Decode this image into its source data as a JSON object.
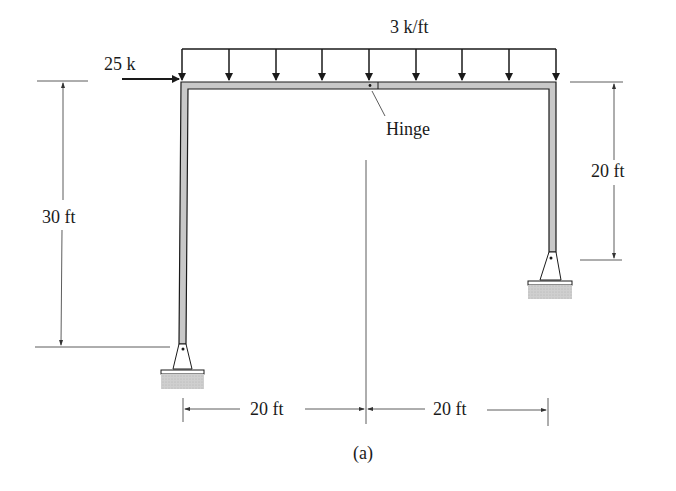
{
  "diagram": {
    "type": "structural-frame",
    "caption": "(a)",
    "loads": {
      "distributed": {
        "label": "3 k/ft",
        "direction": "down",
        "arrow_count": 9
      },
      "point": {
        "label": "25 k",
        "direction": "right"
      }
    },
    "annotations": {
      "hinge": "Hinge"
    },
    "dimensions": {
      "left_height": "30 ft",
      "right_height": "20 ft",
      "left_span": "20 ft",
      "right_span": "20 ft"
    },
    "supports": [
      {
        "name": "left-pin-support",
        "type": "pin"
      },
      {
        "name": "right-pin-support",
        "type": "pin"
      }
    ],
    "colors": {
      "member_fill": "#c8c8c8",
      "line": "#1a1a1a",
      "ground": "#cfcfcf"
    }
  }
}
